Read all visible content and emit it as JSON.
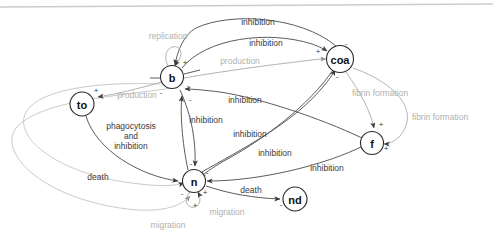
{
  "diagram": {
    "type": "directed-signed-graph",
    "background": "#ffffff",
    "stroke_dark": "#4a4a4a",
    "stroke_gray": "#a9a9a9",
    "text_dark": "#3a3a3a",
    "text_gray": "#b0b0b0"
  },
  "nodes": [
    {
      "id": "b",
      "label": "b",
      "x": 172,
      "y": 77,
      "r": 11.5
    },
    {
      "id": "coa",
      "label": "coa",
      "x": 340,
      "y": 59,
      "r": 13.5
    },
    {
      "id": "to",
      "label": "to",
      "x": 82,
      "y": 104,
      "r": 12
    },
    {
      "id": "f",
      "label": "f",
      "x": 372,
      "y": 143,
      "r": 11.5
    },
    {
      "id": "n",
      "label": "n",
      "x": 194,
      "y": 181,
      "r": 11.5
    },
    {
      "id": "nd",
      "label": "nd",
      "x": 295,
      "y": 199,
      "r": 12
    }
  ],
  "edges": [
    {
      "id": "e1",
      "from": "coa",
      "to": "b",
      "label": "inhibition",
      "sign": "-",
      "color": "dark"
    },
    {
      "id": "e2",
      "from": "b",
      "to": "coa",
      "label": "inhibition",
      "sign": "+",
      "color": "dark"
    },
    {
      "id": "e3",
      "from": "b",
      "to": "b",
      "label": "replication",
      "sign": "+",
      "color": "gray"
    },
    {
      "id": "e4",
      "from": "b",
      "to": "coa",
      "label": "production",
      "sign": "+",
      "color": "gray"
    },
    {
      "id": "e5",
      "from": "b",
      "to": "to",
      "label": "production",
      "sign": "+",
      "color": "gray"
    },
    {
      "id": "e6",
      "from": "n",
      "to": "b",
      "label": "inhibition",
      "sign": "-",
      "color": "dark"
    },
    {
      "id": "e7",
      "from": "b",
      "to": "n",
      "label": "inhibition",
      "sign": "-",
      "color": "dark"
    },
    {
      "id": "e8",
      "from": "to",
      "to": "n",
      "label": "phagocytosis and inhibition",
      "sign": "-",
      "color": "dark"
    },
    {
      "id": "e9",
      "from": "coa",
      "to": "n",
      "label": "inhibition",
      "sign": "-",
      "color": "dark"
    },
    {
      "id": "e10",
      "from": "f",
      "to": "n",
      "label": "inhibition",
      "sign": "-",
      "color": "dark"
    },
    {
      "id": "e11",
      "from": "f",
      "to": "b",
      "label": "inhibition",
      "sign": "-",
      "color": "dark"
    },
    {
      "id": "e12",
      "from": "coa",
      "to": "f",
      "label": "fibrin formation",
      "sign": "+",
      "color": "gray"
    },
    {
      "id": "e13",
      "from": "coa",
      "to": "f",
      "label": "fibrin formation",
      "sign": "+",
      "color": "gray"
    },
    {
      "id": "e14",
      "from": "n",
      "to": "nd",
      "label": "death",
      "sign": "-",
      "color": "dark"
    },
    {
      "id": "e15",
      "from": "to",
      "to": "n",
      "label": "death",
      "sign": "-",
      "color": "dark"
    },
    {
      "id": "e16",
      "from": "n",
      "to": "n",
      "label": "migration",
      "sign": "+",
      "color": "gray"
    },
    {
      "id": "e17",
      "from": "n",
      "to": "n",
      "label": "migration",
      "sign": "+",
      "color": "gray"
    },
    {
      "id": "e18",
      "from": "n",
      "to": "coa",
      "label": "inhibition",
      "sign": "-",
      "color": "dark"
    }
  ],
  "labels": [
    {
      "id": "l1",
      "text": "inhibition",
      "x": 258,
      "y": 22,
      "tone": "dark"
    },
    {
      "id": "l2",
      "text": "inhibition",
      "x": 266,
      "y": 43,
      "tone": "dark"
    },
    {
      "id": "l3",
      "text": "replication",
      "x": 168,
      "y": 36,
      "tone": "gray"
    },
    {
      "id": "l4",
      "text": "production",
      "x": 240,
      "y": 61,
      "tone": "gray"
    },
    {
      "id": "l5",
      "text": "production",
      "x": 137,
      "y": 95,
      "tone": "gray"
    },
    {
      "id": "l6",
      "text": "inhibition",
      "x": 245,
      "y": 100,
      "tone": "dark"
    },
    {
      "id": "l7",
      "text": "inhibition",
      "x": 206,
      "y": 120,
      "tone": "dark"
    },
    {
      "id": "l8",
      "text": "inhibition",
      "x": 250,
      "y": 134,
      "tone": "dark"
    },
    {
      "id": "l9",
      "text": "inhibition",
      "x": 275,
      "y": 153,
      "tone": "dark"
    },
    {
      "id": "l10",
      "text": "inhibition",
      "x": 327,
      "y": 168,
      "tone": "dark"
    },
    {
      "id": "l11",
      "text": "fibrin formation",
      "x": 380,
      "y": 93,
      "tone": "gray"
    },
    {
      "id": "l12",
      "text": "fibrin formation",
      "x": 440,
      "y": 117,
      "tone": "gray"
    },
    {
      "id": "l13",
      "text": "death",
      "x": 98,
      "y": 177,
      "tone": "dark"
    },
    {
      "id": "l14",
      "text": "death",
      "x": 251,
      "y": 190,
      "tone": "dark"
    },
    {
      "id": "l15",
      "text": "migration",
      "x": 227,
      "y": 212,
      "tone": "gray"
    },
    {
      "id": "l16",
      "text": "migration",
      "x": 168,
      "y": 225,
      "tone": "gray"
    }
  ],
  "multiline_labels": [
    {
      "id": "ml1",
      "lines": [
        "phagocytosis",
        "and",
        "inhibition"
      ],
      "x": 131,
      "y": 126,
      "tone": "dark"
    }
  ],
  "signs": [
    {
      "id": "s1",
      "text": "+",
      "x": 185,
      "y": 62
    },
    {
      "id": "s2",
      "text": "-",
      "x": 188,
      "y": 85
    },
    {
      "id": "s3",
      "text": "-",
      "x": 161,
      "y": 92
    },
    {
      "id": "s4",
      "text": "-",
      "x": 190,
      "y": 99
    },
    {
      "id": "s5",
      "text": "+",
      "x": 318,
      "y": 51
    },
    {
      "id": "s6",
      "text": "-",
      "x": 346,
      "y": 43
    },
    {
      "id": "s7",
      "text": "-",
      "x": 337,
      "y": 76
    },
    {
      "id": "s8",
      "text": "+",
      "x": 96,
      "y": 90
    },
    {
      "id": "s9",
      "text": "+",
      "x": 381,
      "y": 124
    },
    {
      "id": "s10",
      "text": "+",
      "x": 386,
      "y": 148
    },
    {
      "id": "s11",
      "text": "-",
      "x": 191,
      "y": 163
    },
    {
      "id": "s12",
      "text": "-",
      "x": 207,
      "y": 172
    },
    {
      "id": "s13",
      "text": "-",
      "x": 182,
      "y": 193
    },
    {
      "id": "s14",
      "text": "+",
      "x": 205,
      "y": 192
    },
    {
      "id": "s15",
      "text": "+",
      "x": 195,
      "y": 205
    },
    {
      "id": "s16",
      "text": "-",
      "x": 281,
      "y": 204
    }
  ]
}
